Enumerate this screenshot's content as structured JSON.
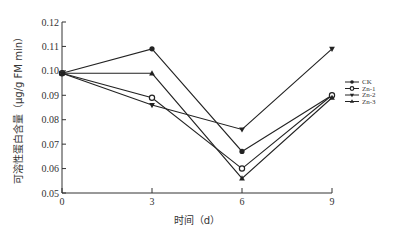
{
  "chart_data": {
    "type": "line",
    "title": "",
    "xlabel": "时间（d）",
    "ylabel": "可溶性蛋白含量（μg/g FM min）",
    "x": [
      0,
      3,
      6,
      9
    ],
    "xticks": [
      "0",
      "3",
      "6",
      "9"
    ],
    "yticks": [
      "0.05",
      "0.06",
      "0.07",
      "0.08",
      "0.09",
      "0.10",
      "0.11",
      "0.12"
    ],
    "ylim": [
      0.05,
      0.12
    ],
    "xlim": [
      0,
      9
    ],
    "grid": false,
    "legend_position": "right",
    "series": [
      {
        "name": "CK",
        "marker": "filled-circle",
        "values": [
          0.099,
          0.109,
          0.067,
          0.09
        ]
      },
      {
        "name": "Zn-1",
        "marker": "open-circle",
        "values": [
          0.099,
          0.089,
          0.06,
          0.09
        ]
      },
      {
        "name": "Zn-2",
        "marker": "inverted-triangle",
        "values": [
          0.099,
          0.086,
          0.076,
          0.109
        ]
      },
      {
        "name": "Zn-3",
        "marker": "triangle",
        "values": [
          0.099,
          0.099,
          0.056,
          0.089
        ]
      }
    ]
  },
  "colors": {
    "line": "#222222",
    "axis": "#333333",
    "background": "#ffffff"
  }
}
